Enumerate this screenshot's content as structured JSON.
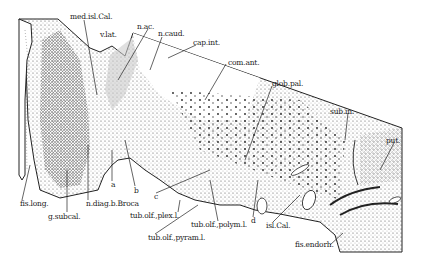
{
  "figure": {
    "type": "histological section diagram (coronal brain section, basal forebrain)",
    "labels": [
      {
        "id": "med-isl-cal",
        "text": "med.isl.Cal.",
        "x": 70,
        "y": 17
      },
      {
        "id": "v-lat",
        "text": "v.lat.",
        "x": 100,
        "y": 34
      },
      {
        "id": "n-ac",
        "text": "n.ac.",
        "x": 137,
        "y": 26
      },
      {
        "id": "n-caud",
        "text": "n.caud.",
        "x": 158,
        "y": 33
      },
      {
        "id": "cap-int",
        "text": "cap.int.",
        "x": 193,
        "y": 42
      },
      {
        "id": "com-ant",
        "text": "com.ant.",
        "x": 228,
        "y": 62
      },
      {
        "id": "glob-pal",
        "text": "glob.pal.",
        "x": 272,
        "y": 83
      },
      {
        "id": "sub-in",
        "text": "sub.in.",
        "x": 330,
        "y": 111
      },
      {
        "id": "put",
        "text": "put.",
        "x": 386,
        "y": 140
      },
      {
        "id": "fis-long",
        "text": "fis.long.",
        "x": 20,
        "y": 203
      },
      {
        "id": "g-subcal",
        "text": "g.subcal.",
        "x": 48,
        "y": 216
      },
      {
        "id": "n-diag-b-broca",
        "text": "n.diag.b.Broca",
        "x": 86,
        "y": 203
      },
      {
        "id": "a",
        "text": "a",
        "x": 111,
        "y": 184
      },
      {
        "id": "b",
        "text": "b",
        "x": 134,
        "y": 190
      },
      {
        "id": "c",
        "text": "c",
        "x": 154,
        "y": 196
      },
      {
        "id": "d",
        "text": "d",
        "x": 251,
        "y": 220
      },
      {
        "id": "tub-olf-plex-l",
        "text": "tub.olf.,plex.l.",
        "x": 130,
        "y": 215
      },
      {
        "id": "tub-olf-polym-l",
        "text": "tub.olf.,polym.l.",
        "x": 191,
        "y": 224
      },
      {
        "id": "tub-olf-pyram-l",
        "text": "tub.olf.,pyram.l.",
        "x": 148,
        "y": 237
      },
      {
        "id": "isl-cal",
        "text": "isl.Cal.",
        "x": 266,
        "y": 225
      },
      {
        "id": "fis-endorh",
        "text": "fis.endorh.",
        "x": 295,
        "y": 244
      }
    ]
  }
}
